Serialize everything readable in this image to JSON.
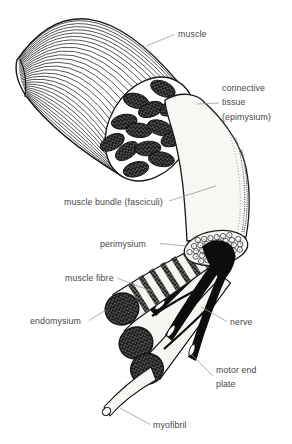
{
  "figure": {
    "background": "#ffffff",
    "ink_color": "#1a1a1a",
    "label_color": "#474747",
    "leader_color": "#9b9b9b"
  },
  "labels": {
    "muscle": "muscle",
    "connective_tissue_1": "connective",
    "connective_tissue_2": "tissue",
    "connective_tissue_3": "(epimysium)",
    "muscle_bundle": "muscle bundle (fasciculi)",
    "perimysium": "perimysium",
    "muscle_fibre": "muscle fibre",
    "endomysium": "endomysium",
    "nerve": "nerve",
    "motor_end_plate_1": "motor end",
    "motor_end_plate_2": "plate",
    "myofibril": "myofibril"
  }
}
